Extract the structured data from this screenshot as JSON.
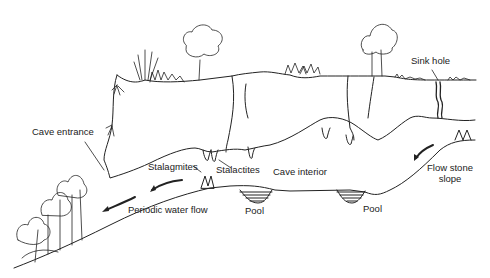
{
  "diagram": {
    "type": "cave cross-section",
    "labels": {
      "cave_entrance": "Cave entrance",
      "stalagmites": "Stalagmites",
      "stalactites": "Stalactites",
      "cave_interior": "Cave interior",
      "periodic_water_flow": "Periodic water flow",
      "pool_left": "Pool",
      "pool_right": "Pool",
      "sink_hole": "Sink hole",
      "flow_stone_line1": "Flow stone",
      "flow_stone_line2": "slope"
    },
    "colors": {
      "line": "#222222",
      "background": "#ffffff"
    }
  }
}
